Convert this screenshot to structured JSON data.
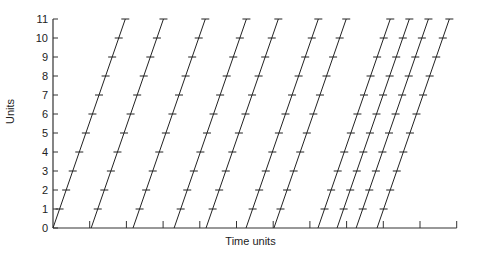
{
  "chart_data": {
    "type": "line",
    "title": "",
    "xlabel": "Time units",
    "ylabel": "Units",
    "xlim": [
      0,
      11
    ],
    "ylim": [
      0,
      11
    ],
    "y_ticks": [
      0,
      1,
      2,
      3,
      4,
      5,
      6,
      7,
      8,
      9,
      10,
      11
    ],
    "x_ticks_unlabeled": [
      0,
      1,
      2,
      3,
      4,
      5,
      6,
      7,
      8,
      9,
      10,
      11
    ],
    "grid": false,
    "legend": null,
    "series": [
      {
        "name": "line-1",
        "start_time": 0.0,
        "end_time": 1.97,
        "y_start": 0,
        "y_end": 11
      },
      {
        "name": "line-2",
        "start_time": 1.04,
        "end_time": 3.01,
        "y_start": 0,
        "y_end": 11
      },
      {
        "name": "line-3",
        "start_time": 2.18,
        "end_time": 4.15,
        "y_start": 0,
        "y_end": 11
      },
      {
        "name": "line-4",
        "start_time": 3.3,
        "end_time": 5.27,
        "y_start": 0,
        "y_end": 11
      },
      {
        "name": "line-5",
        "start_time": 4.17,
        "end_time": 6.14,
        "y_start": 0,
        "y_end": 11
      },
      {
        "name": "line-6",
        "start_time": 5.26,
        "end_time": 7.23,
        "y_start": 0,
        "y_end": 11
      },
      {
        "name": "line-7",
        "start_time": 6.02,
        "end_time": 7.99,
        "y_start": 0,
        "y_end": 11
      },
      {
        "name": "line-8",
        "start_time": 7.22,
        "end_time": 9.19,
        "y_start": 0,
        "y_end": 11
      },
      {
        "name": "line-9",
        "start_time": 7.74,
        "end_time": 9.71,
        "y_start": 0,
        "y_end": 11
      },
      {
        "name": "line-10",
        "start_time": 8.26,
        "end_time": 10.23,
        "y_start": 0,
        "y_end": 11
      },
      {
        "name": "line-11",
        "start_time": 8.83,
        "end_time": 10.8,
        "y_start": 0,
        "y_end": 11
      }
    ]
  },
  "axes": {
    "x_label": "Time units",
    "y_label": "Units"
  },
  "style": {
    "line_color": "#222222",
    "axis_color": "#333333"
  }
}
